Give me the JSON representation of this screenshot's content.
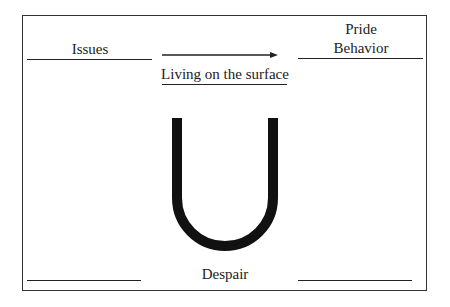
{
  "diagram": {
    "labels": {
      "issues": "Issues",
      "pride": "Pride",
      "behavior": "Behavior",
      "surface": "Living on the surface",
      "despair": "Despair"
    },
    "shape": "U-curve",
    "arrow_direction": "right",
    "colors": {
      "ink": "#222222",
      "curve": "#111111",
      "background": "#ffffff"
    }
  }
}
